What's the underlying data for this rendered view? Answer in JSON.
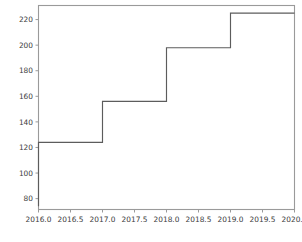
{
  "chart_data": {
    "type": "line",
    "subtype": "step-post",
    "title": "",
    "xlabel": "",
    "ylabel": "",
    "xlim": [
      2016.0,
      2020.0
    ],
    "ylim": [
      71.5,
      231.0
    ],
    "grid": false,
    "legend": null,
    "xticks": [
      2016.0,
      2016.5,
      2017.0,
      2017.5,
      2018.0,
      2018.5,
      2019.0,
      2019.5,
      2020.0
    ],
    "xtick_labels": [
      "2016.0",
      "2016.5",
      "2017.0",
      "2017.5",
      "2018.0",
      "2018.5",
      "2019.0",
      "2019.5",
      "2020.0"
    ],
    "yticks": [
      80,
      100,
      120,
      140,
      160,
      180,
      200,
      220
    ],
    "ytick_labels": [
      "80",
      "100",
      "120",
      "140",
      "160",
      "180",
      "200",
      "220"
    ],
    "series": [
      {
        "name": "cumulative",
        "color": "#5c5c5c",
        "x": [
          2016.0,
          2017.0,
          2018.0,
          2019.0,
          2020.0
        ],
        "values": [
          124,
          156,
          198,
          225,
          225
        ],
        "baseline_start": 74
      }
    ],
    "steps": [
      {
        "x_start": 2016.0,
        "x_end": 2017.0,
        "y": 124
      },
      {
        "x_start": 2017.0,
        "x_end": 2018.0,
        "y": 156
      },
      {
        "x_start": 2018.0,
        "x_end": 2019.0,
        "y": 198
      },
      {
        "x_start": 2019.0,
        "x_end": 2020.0,
        "y": 225
      }
    ],
    "colors": {
      "line": "#5c5c5c",
      "spine": "#9a9a9a",
      "tick_text": "#3c3c3c",
      "background": "#ffffff"
    }
  }
}
